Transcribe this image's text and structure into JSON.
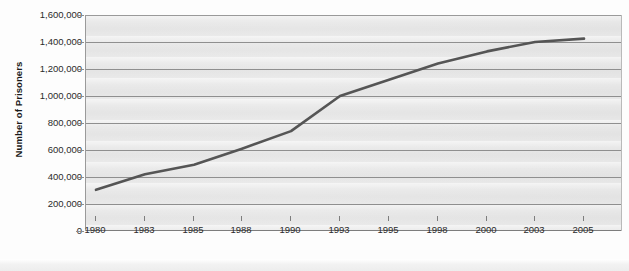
{
  "chart_data": {
    "type": "line",
    "title": "",
    "xlabel": "",
    "ylabel": "Number of Prisoners",
    "x": [
      1980,
      1983,
      1985,
      1988,
      1990,
      1993,
      1995,
      1998,
      2000,
      2003,
      2005
    ],
    "xtick_labels": [
      "1980",
      "1983",
      "1985",
      "1988",
      "1990",
      "1993",
      "1995",
      "1998",
      "2000",
      "2003",
      "2005"
    ],
    "ytick_labels": [
      "1,600,000",
      "1,400,000",
      "1,200,000",
      "1,000,000",
      "800,000",
      "600,000",
      "400,000",
      "200,000",
      "0"
    ],
    "ytick_values": [
      1600000,
      1400000,
      1200000,
      1000000,
      800000,
      600000,
      400000,
      200000,
      0
    ],
    "ylim": [
      0,
      1600000
    ],
    "grid": "horizontal",
    "legend": "none",
    "series": [
      {
        "name": "Number of Prisoners",
        "color": "#555555",
        "values": [
          305000,
          420000,
          490000,
          610000,
          740000,
          1000000,
          1120000,
          1240000,
          1330000,
          1400000,
          1425000
        ]
      }
    ]
  },
  "colors": {
    "line": "#555555",
    "plot_background": "#e9e9e9",
    "gridline": "#8f8f8f",
    "axis": "#7d7d7d",
    "text": "#2b2b2b"
  }
}
